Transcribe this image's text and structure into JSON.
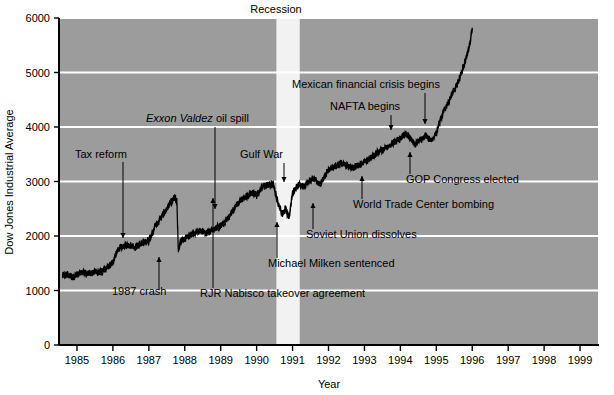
{
  "chart_data": {
    "type": "line",
    "title": "",
    "xlabel": "Year",
    "ylabel": "Dow Jones Industrial Average",
    "xlim": [
      1984.5,
      1999.5
    ],
    "ylim": [
      0,
      6000
    ],
    "ytick_labels": [
      "0",
      "1000",
      "2000",
      "3000",
      "4000",
      "5000",
      "6000"
    ],
    "ytick_values": [
      0,
      1000,
      2000,
      3000,
      4000,
      5000,
      6000
    ],
    "xtick_labels": [
      "1985",
      "1986",
      "1987",
      "1988",
      "1989",
      "1990",
      "1991",
      "1992",
      "1993",
      "1994",
      "1995",
      "1996",
      "1997",
      "1998",
      "1999"
    ],
    "xtick_values": [
      1985,
      1986,
      1987,
      1988,
      1989,
      1990,
      1991,
      1992,
      1993,
      1994,
      1995,
      1996,
      1997,
      1998,
      1999
    ],
    "grid": "horizontal-white-lines",
    "legend": "none",
    "plot_background": "#9c9c9c",
    "grid_color": "#ffffff",
    "series_color": "#000000",
    "series_name": "Dow Jones Industrial Average",
    "series_x": [
      1984.6,
      1984.75,
      1984.9,
      1985.0,
      1985.15,
      1985.3,
      1985.45,
      1985.6,
      1985.75,
      1985.9,
      1986.0,
      1986.15,
      1986.3,
      1986.45,
      1986.6,
      1986.75,
      1986.9,
      1987.0,
      1987.15,
      1987.3,
      1987.45,
      1987.6,
      1987.72,
      1987.78,
      1987.82,
      1987.9,
      1988.0,
      1988.15,
      1988.3,
      1988.45,
      1988.6,
      1988.75,
      1988.9,
      1989.0,
      1989.15,
      1989.3,
      1989.45,
      1989.6,
      1989.75,
      1989.9,
      1990.0,
      1990.15,
      1990.3,
      1990.45,
      1990.6,
      1990.72,
      1990.8,
      1990.9,
      1991.0,
      1991.15,
      1991.3,
      1991.45,
      1991.6,
      1991.75,
      1991.9,
      1992.0,
      1992.2,
      1992.4,
      1992.6,
      1992.8,
      1993.0,
      1993.2,
      1993.4,
      1993.6,
      1993.8,
      1993.95,
      1994.1,
      1994.25,
      1994.4,
      1994.55,
      1994.7,
      1994.85,
      1995.0,
      1995.15,
      1995.3,
      1995.45,
      1995.6,
      1995.75,
      1995.9,
      1996.0
    ],
    "series_y": [
      1270,
      1290,
      1250,
      1290,
      1320,
      1310,
      1330,
      1340,
      1360,
      1450,
      1520,
      1760,
      1820,
      1840,
      1790,
      1840,
      1900,
      1920,
      2150,
      2300,
      2450,
      2600,
      2700,
      2640,
      1750,
      1920,
      1950,
      2020,
      2080,
      2100,
      2050,
      2110,
      2150,
      2180,
      2280,
      2420,
      2580,
      2680,
      2740,
      2800,
      2750,
      2900,
      2940,
      2960,
      2600,
      2400,
      2500,
      2330,
      2800,
      2950,
      2900,
      3000,
      3050,
      2950,
      3100,
      3220,
      3300,
      3330,
      3250,
      3290,
      3350,
      3450,
      3550,
      3620,
      3700,
      3760,
      3850,
      3830,
      3680,
      3760,
      3830,
      3750,
      3900,
      4200,
      4400,
      4600,
      4800,
      5100,
      5400,
      5800
    ],
    "recession_band": {
      "label": "Recession",
      "start": 1990.55,
      "end": 1991.2,
      "color": "#f2f2f2"
    },
    "annotations": [
      {
        "text": "Tax reform",
        "style": "normal",
        "anchor": "start",
        "text_x": 75,
        "text_y": 158,
        "line_x": 123,
        "line_y1": 162,
        "line_y2": 238,
        "arrow": "down"
      },
      {
        "text": "Exxon Valdez",
        "style": "italic",
        "anchor": "start",
        "text_x": 146,
        "text_y": 122,
        "line_x": 215,
        "line_y1": 127,
        "line_y2": 209,
        "arrow": "down",
        "suffix": " oil spill"
      },
      {
        "text": "Gulf War",
        "style": "normal",
        "anchor": "start",
        "text_x": 240,
        "text_y": 158,
        "line_x": 284,
        "line_y1": 163,
        "line_y2": 182,
        "arrow": "down"
      },
      {
        "text": "Mexican financial crisis begins",
        "style": "normal",
        "anchor": "start",
        "text_x": 292,
        "text_y": 88,
        "line_x": 425,
        "line_y1": 93,
        "line_y2": 124,
        "arrow": "down"
      },
      {
        "text": "NAFTA begins",
        "style": "normal",
        "anchor": "start",
        "text_x": 330,
        "text_y": 110,
        "line_x": 391,
        "line_y1": 115,
        "line_y2": 130,
        "arrow": "down"
      },
      {
        "text": "1987 crash",
        "style": "normal",
        "anchor": "start",
        "text_x": 112,
        "text_y": 295,
        "line_x": 159,
        "line_y1": 290,
        "line_y2": 257,
        "arrow": "up"
      },
      {
        "text": "RJR Nabisco takeover agreement",
        "style": "normal",
        "anchor": "start",
        "text_x": 200,
        "text_y": 297,
        "line_x": 213,
        "line_y1": 288,
        "line_y2": 198,
        "arrow": "up"
      },
      {
        "text": "Michael Milken sentenced",
        "style": "normal",
        "anchor": "start",
        "text_x": 268,
        "text_y": 267,
        "line_x": 277,
        "line_y1": 258,
        "line_y2": 222,
        "arrow": "up"
      },
      {
        "text": "Soviet Union dissolves",
        "style": "normal",
        "anchor": "start",
        "text_x": 306,
        "text_y": 238,
        "line_x": 313,
        "line_y1": 229,
        "line_y2": 203,
        "arrow": "up"
      },
      {
        "text": "World Trade Center bombing",
        "style": "normal",
        "anchor": "start",
        "text_x": 353,
        "text_y": 208,
        "line_x": 362,
        "line_y1": 199,
        "line_y2": 176,
        "arrow": "up"
      },
      {
        "text": "GOP Congress elected",
        "style": "normal",
        "anchor": "start",
        "text_x": 406,
        "text_y": 183,
        "line_x": 410,
        "line_y1": 174,
        "line_y2": 152,
        "arrow": "up"
      }
    ]
  },
  "figure": {
    "ylabel": "Dow Jones Industrial Average",
    "xlabel": "Year",
    "recession_label": "Recession"
  }
}
